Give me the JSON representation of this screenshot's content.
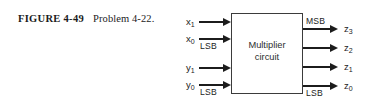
{
  "figure": {
    "caption_label": "FIGURE 4-49",
    "caption_text": "Problem 4-22."
  },
  "block": {
    "line1": "Multiplier",
    "line2": "circuit"
  },
  "inputs": [
    {
      "name": "x1",
      "base": "x",
      "sub": "1",
      "note": ""
    },
    {
      "name": "x0",
      "base": "x",
      "sub": "0",
      "note": "LSB"
    },
    {
      "name": "y1",
      "base": "y",
      "sub": "1",
      "note": ""
    },
    {
      "name": "y0",
      "base": "y",
      "sub": "0",
      "note": "LSB"
    }
  ],
  "outputs": [
    {
      "name": "z3",
      "base": "z",
      "sub": "3",
      "note": "MSB"
    },
    {
      "name": "z2",
      "base": "z",
      "sub": "2",
      "note": ""
    },
    {
      "name": "z1",
      "base": "z",
      "sub": "1",
      "note": ""
    },
    {
      "name": "z0",
      "base": "z",
      "sub": "0",
      "note": "LSB"
    }
  ],
  "colors": {
    "ink": "#1c1c1c",
    "box_border": "#3b3b3b",
    "background": "#ffffff"
  }
}
